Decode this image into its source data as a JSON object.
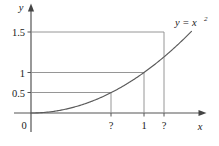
{
  "figure": {
    "title": "",
    "axis_labels": {
      "x": "x",
      "y": "y"
    },
    "curve_label": {
      "base": "y = x",
      "exponent": "2",
      "full": "y = x²"
    },
    "origin_label": "0",
    "y_ticks": [
      {
        "label": "0.5",
        "value": 0.5
      },
      {
        "label": "1",
        "value": 1
      },
      {
        "label": "1.5",
        "value": 1.5
      }
    ],
    "x_ticks": [
      {
        "label": "?",
        "value": null
      },
      {
        "label": "1",
        "value": 1
      },
      {
        "label": "?",
        "value": null
      }
    ]
  },
  "chart_data": {
    "type": "line",
    "title": "",
    "xlabel": "x",
    "ylabel": "y",
    "function": "y = x^2",
    "xlim": [
      -0.08,
      1.42
    ],
    "ylim": [
      -0.18,
      1.88
    ],
    "grid": false,
    "legend": "none",
    "annotations": [
      {
        "text": "y = x²",
        "x": 1.33,
        "y": 1.72
      },
      {
        "text": "0",
        "x": -0.05,
        "y": -0.12
      }
    ],
    "xticks": {
      "positions": [
        0.7071,
        1,
        1.2247
      ],
      "labels": [
        "?",
        "1",
        "?"
      ]
    },
    "yticks": {
      "positions": [
        0.5,
        1,
        1.5
      ],
      "labels": [
        "0.5",
        "1",
        "1.5"
      ]
    },
    "guide_lines": [
      {
        "type": "horizontal",
        "y": 0.5,
        "from_x": 0,
        "to_x": 0.7071
      },
      {
        "type": "horizontal",
        "y": 1,
        "from_x": 0,
        "to_x": 1
      },
      {
        "type": "horizontal",
        "y": 1.5,
        "from_x": 0,
        "to_x": 1.2247
      },
      {
        "type": "vertical",
        "x": 0.7071,
        "from_y": 0,
        "to_y": 0.5
      },
      {
        "type": "vertical",
        "x": 1,
        "from_y": 0,
        "to_y": 1
      },
      {
        "type": "vertical",
        "x": 1.2247,
        "from_y": 0,
        "to_y": 1.5
      }
    ],
    "series": [
      {
        "name": "y = x^2",
        "x": [
          0,
          0.1,
          0.2,
          0.3,
          0.4,
          0.5,
          0.6,
          0.7071,
          0.8,
          0.9,
          1,
          1.1,
          1.2247,
          1.3
        ],
        "values": [
          0,
          0.01,
          0.04,
          0.09,
          0.16,
          0.25,
          0.36,
          0.5,
          0.64,
          0.81,
          1,
          1.21,
          1.5,
          1.69
        ]
      }
    ]
  }
}
